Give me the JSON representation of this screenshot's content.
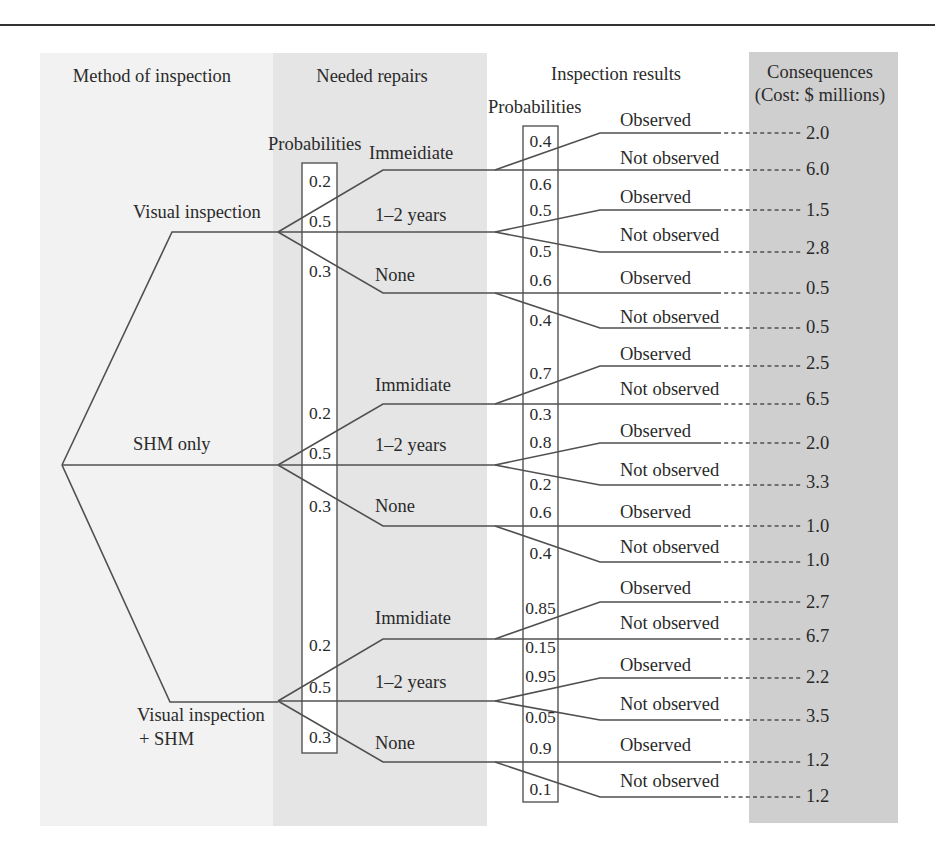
{
  "headers": {
    "method": "Method of inspection",
    "repairs": "Needed repairs",
    "results": "Inspection results",
    "consequences": "Consequences",
    "consequences_unit": "(Cost: $ millions)",
    "repairs_prob_label": "Probabilities",
    "results_prob_label": "Probabilities"
  },
  "colors": {
    "band_method": "#f2f2f2",
    "band_repairs": "#e5e5e5",
    "band_consequences": "#cfcfcf",
    "line": "#505050"
  },
  "methods": [
    {
      "label_lines": [
        "Visual inspection"
      ],
      "repairs": [
        {
          "label": "Immeidiate",
          "prob": "0.2",
          "results": [
            {
              "label": "Observed",
              "prob": "0.4",
              "cost": "2.0"
            },
            {
              "label": "Not observed",
              "prob": "0.6",
              "cost": "6.0"
            }
          ]
        },
        {
          "label": "1–2 years",
          "prob": "0.5",
          "results": [
            {
              "label": "Observed",
              "prob": "0.5",
              "cost": "1.5"
            },
            {
              "label": "Not observed",
              "prob": "0.5",
              "cost": "2.8"
            }
          ]
        },
        {
          "label": "None",
          "prob": "0.3",
          "results": [
            {
              "label": "Observed",
              "prob": "0.6",
              "cost": "0.5"
            },
            {
              "label": "Not observed",
              "prob": "0.4",
              "cost": "0.5"
            }
          ]
        }
      ]
    },
    {
      "label_lines": [
        "SHM only"
      ],
      "repairs": [
        {
          "label": "Immidiate",
          "prob": "0.2",
          "results": [
            {
              "label": "Observed",
              "prob": "0.7",
              "cost": "2.5"
            },
            {
              "label": "Not observed",
              "prob": "0.3",
              "cost": "6.5"
            }
          ]
        },
        {
          "label": "1–2 years",
          "prob": "0.5",
          "results": [
            {
              "label": "Observed",
              "prob": "0.8",
              "cost": "2.0"
            },
            {
              "label": "Not observed",
              "prob": "0.2",
              "cost": "3.3"
            }
          ]
        },
        {
          "label": "None",
          "prob": "0.3",
          "results": [
            {
              "label": "Observed",
              "prob": "0.6",
              "cost": "1.0"
            },
            {
              "label": "Not observed",
              "prob": "0.4",
              "cost": "1.0"
            }
          ]
        }
      ]
    },
    {
      "label_lines": [
        "Visual inspection",
        "+ SHM"
      ],
      "repairs": [
        {
          "label": "Immidiate",
          "prob": "0.2",
          "results": [
            {
              "label": "Observed",
              "prob": "0.85",
              "cost": "2.7"
            },
            {
              "label": "Not observed",
              "prob": "0.15",
              "cost": "6.7"
            }
          ]
        },
        {
          "label": "1–2 years",
          "prob": "0.5",
          "results": [
            {
              "label": "Observed",
              "prob": "0.95",
              "cost": "2.2"
            },
            {
              "label": "Not observed",
              "prob": "0.05",
              "cost": "3.5"
            }
          ]
        },
        {
          "label": "None",
          "prob": "0.3",
          "results": [
            {
              "label": "Observed",
              "prob": "0.9",
              "cost": "1.2"
            },
            {
              "label": "Not observed",
              "prob": "0.1",
              "cost": "1.2"
            }
          ]
        }
      ]
    }
  ]
}
